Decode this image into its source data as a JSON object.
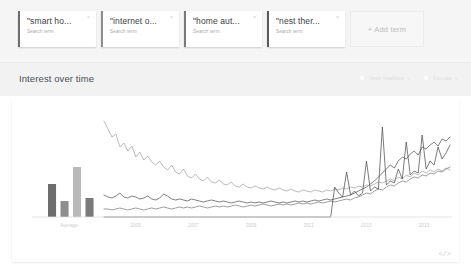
{
  "terms": {
    "cards": [
      {
        "title": "\"smart ho...",
        "subtitle": "Search term",
        "close": "×",
        "accent": "#6d6d6d"
      },
      {
        "title": "\"internet o...",
        "subtitle": "Search term",
        "close": "×",
        "accent": "#8e8e8e"
      },
      {
        "title": "\"home aut...",
        "subtitle": "Search term",
        "close": "×",
        "accent": "#7a7a7a"
      },
      {
        "title": "\"nest ther...",
        "subtitle": "Search term",
        "close": "×",
        "accent": "#5c5c5c"
      }
    ],
    "add_label": "+ Add term"
  },
  "section": {
    "title": "Interest over time",
    "tools": [
      {
        "label": "News headlines",
        "caret": "▾",
        "icon": "news-toggle-icon"
      },
      {
        "label": "Forecast",
        "caret": "▾",
        "icon": "forecast-toggle-icon"
      }
    ]
  },
  "footer": {
    "embed_icon": "</>"
  },
  "chart_data": {
    "type": "line",
    "title": "Interest over time",
    "xlabel": "",
    "ylabel": "",
    "ylim": [
      0,
      100
    ],
    "grid": false,
    "legend_position": "top-cards",
    "average_panel": {
      "type": "bar",
      "label": "Average",
      "categories": [
        "smart ho...",
        "internet o...",
        "home aut...",
        "nest ther..."
      ],
      "values": [
        33,
        16,
        50,
        19
      ],
      "colors": [
        "#6d6d6d",
        "#8e8e8e",
        "#b9b9b9",
        "#7a7a7a"
      ]
    },
    "tick_labels": [
      "Average",
      "2005",
      "2007",
      "2009",
      "2011",
      "2013",
      "2015"
    ],
    "series": [
      {
        "name": "\"smart ho...",
        "color": "#555555",
        "values": [
          22,
          20,
          19,
          21,
          24,
          20,
          19,
          21,
          20,
          18,
          19,
          21,
          18,
          17,
          19,
          23,
          21,
          18,
          17,
          18,
          17,
          16,
          18,
          17,
          16,
          15,
          16,
          17,
          16,
          15,
          16,
          15,
          14,
          15,
          16,
          15,
          14,
          15,
          14,
          15,
          14,
          15,
          16,
          15,
          14,
          15,
          14,
          15,
          16,
          15,
          16,
          15,
          16,
          17,
          16,
          17,
          18,
          17,
          18,
          19,
          20,
          21,
          22,
          24,
          26,
          28,
          30,
          33,
          36,
          40,
          44,
          48,
          52,
          49,
          56,
          60,
          58,
          63,
          66,
          62,
          70,
          68,
          72,
          75,
          71,
          78,
          76,
          80
        ]
      },
      {
        "name": "\"internet o...",
        "color": "#9d9d9d",
        "values": [
          96,
          88,
          80,
          83,
          70,
          74,
          66,
          71,
          60,
          65,
          57,
          61,
          55,
          52,
          56,
          50,
          47,
          52,
          45,
          43,
          48,
          41,
          39,
          43,
          38,
          36,
          40,
          35,
          34,
          37,
          33,
          32,
          35,
          31,
          30,
          33,
          30,
          29,
          31,
          29,
          28,
          30,
          28,
          27,
          29,
          27,
          26,
          28,
          26,
          25,
          27,
          26,
          25,
          27,
          26,
          25,
          27,
          26,
          28,
          27,
          29,
          28,
          30,
          29,
          31,
          30,
          32,
          31,
          33,
          35,
          34,
          36,
          38,
          36,
          40,
          38,
          42,
          40,
          44,
          42,
          46,
          44,
          47,
          45,
          48,
          46,
          49,
          47
        ]
      },
      {
        "name": "\"home aut...",
        "color": "#7d7d7d",
        "values": [
          8,
          8,
          7,
          8,
          9,
          8,
          7,
          8,
          9,
          8,
          7,
          8,
          9,
          8,
          9,
          10,
          9,
          8,
          9,
          10,
          9,
          10,
          9,
          10,
          11,
          10,
          9,
          10,
          11,
          10,
          11,
          10,
          11,
          12,
          11,
          10,
          11,
          12,
          11,
          12,
          13,
          12,
          11,
          12,
          13,
          12,
          13,
          12,
          13,
          14,
          13,
          14,
          13,
          14,
          15,
          14,
          15,
          16,
          15,
          16,
          17,
          18,
          17,
          19,
          20,
          22,
          24,
          23,
          26,
          28,
          27,
          30,
          32,
          31,
          34,
          36,
          35,
          38,
          40,
          39,
          42,
          41,
          44,
          43,
          46,
          45,
          48,
          50
        ]
      },
      {
        "name": "\"nest ther...",
        "color": "#4f4f4f",
        "values": [
          0,
          0,
          0,
          0,
          0,
          0,
          0,
          0,
          0,
          0,
          0,
          0,
          0,
          0,
          0,
          0,
          0,
          0,
          0,
          0,
          0,
          0,
          0,
          0,
          0,
          0,
          0,
          0,
          0,
          0,
          0,
          0,
          0,
          0,
          0,
          0,
          0,
          0,
          0,
          0,
          0,
          0,
          0,
          0,
          0,
          0,
          0,
          0,
          0,
          0,
          0,
          0,
          0,
          0,
          0,
          0,
          0,
          0,
          30,
          24,
          20,
          45,
          22,
          26,
          21,
          24,
          56,
          26,
          30,
          28,
          90,
          32,
          36,
          34,
          48,
          38,
          75,
          42,
          46,
          44,
          82,
          48,
          56,
          52,
          70,
          58,
          64,
          72
        ]
      }
    ]
  }
}
